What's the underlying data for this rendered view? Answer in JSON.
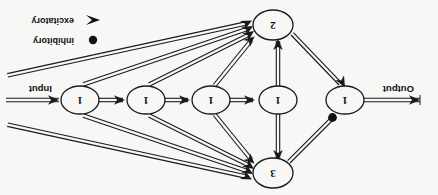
{
  "figure": {
    "kind": "neural-circuit-diagram",
    "orientation": "rotated-180",
    "background_color": "#f7f7f6",
    "stroke_color": "#1a1a1a"
  },
  "io": {
    "input_label": "Input",
    "output_label": "Output"
  },
  "nodes": [
    {
      "id": "chain-1",
      "label": "1",
      "cx": 93,
      "cy": 95,
      "rx": 19,
      "ry": 14
    },
    {
      "id": "chain-2",
      "label": "1",
      "cx": 160,
      "cy": 95,
      "rx": 19,
      "ry": 14
    },
    {
      "id": "chain-3",
      "label": "1",
      "cx": 227,
      "cy": 95,
      "rx": 19,
      "ry": 14
    },
    {
      "id": "chain-4",
      "label": "1",
      "cx": 292,
      "cy": 95,
      "rx": 19,
      "ry": 14
    },
    {
      "id": "chain-5",
      "label": "1",
      "cx": 358,
      "cy": 95,
      "rx": 19,
      "ry": 14
    },
    {
      "id": "top",
      "label": "3",
      "cx": 165,
      "cy": 22,
      "rx": 20,
      "ry": 15
    },
    {
      "id": "bottom",
      "label": "2",
      "cx": 165,
      "cy": 170,
      "rx": 20,
      "ry": 15
    }
  ],
  "legend": {
    "items": [
      {
        "marker": "filled-dot",
        "label": "inhibitory"
      },
      {
        "marker": "arrow-head",
        "label": "excitatory"
      }
    ]
  }
}
